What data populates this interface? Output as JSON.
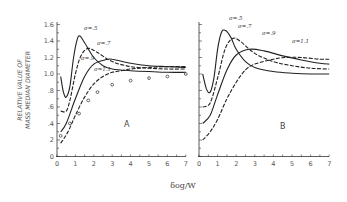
{
  "chart_data": [
    {
      "type": "line",
      "panel": "A",
      "title": "A",
      "xlabel": "δog/W",
      "ylabel": "RELATIVE VALUE OF MASS MEDIAN DIAMETER",
      "xlim": [
        0,
        7
      ],
      "ylim": [
        0,
        1.6
      ],
      "x_ticks": [
        "0",
        "1",
        "2",
        "3",
        "4",
        "5",
        "6",
        "7"
      ],
      "y_ticks": [
        "0",
        "2",
        ".4",
        ".6",
        ".8",
        "1.0",
        "1.2",
        "1.4",
        "1.6"
      ],
      "grid": false,
      "series": [
        {
          "name": "σ=.5",
          "style": "solid",
          "points": [
            [
              0.2,
              0.97
            ],
            [
              0.35,
              0.78
            ],
            [
              0.5,
              0.72
            ],
            [
              0.7,
              0.85
            ],
            [
              0.9,
              1.2
            ],
            [
              1.1,
              1.42
            ],
            [
              1.25,
              1.46
            ],
            [
              1.5,
              1.38
            ],
            [
              2.0,
              1.2
            ],
            [
              2.5,
              1.1
            ],
            [
              3.0,
              1.06
            ],
            [
              4.0,
              1.04
            ],
            [
              5.0,
              1.03
            ],
            [
              6.0,
              1.02
            ],
            [
              7.0,
              1.02
            ]
          ]
        },
        {
          "name": "σ=.7",
          "style": "dashed",
          "points": [
            [
              0.2,
              0.55
            ],
            [
              0.5,
              0.55
            ],
            [
              0.7,
              0.68
            ],
            [
              1.0,
              1.0
            ],
            [
              1.3,
              1.22
            ],
            [
              1.7,
              1.31
            ],
            [
              2.2,
              1.26
            ],
            [
              3.0,
              1.15
            ],
            [
              4.0,
              1.09
            ],
            [
              5.0,
              1.07
            ],
            [
              6.0,
              1.06
            ],
            [
              7.0,
              1.06
            ]
          ]
        },
        {
          "name": "σ=.9",
          "style": "solid",
          "points": [
            [
              0.2,
              0.3
            ],
            [
              0.5,
              0.4
            ],
            [
              1.0,
              0.7
            ],
            [
              1.5,
              0.97
            ],
            [
              2.0,
              1.12
            ],
            [
              2.6,
              1.17
            ],
            [
              3.0,
              1.18
            ],
            [
              4.0,
              1.13
            ],
            [
              5.0,
              1.1
            ],
            [
              6.0,
              1.09
            ],
            [
              7.0,
              1.08
            ]
          ]
        },
        {
          "name": "σ=1.1",
          "style": "dashed",
          "points": [
            [
              0.2,
              0.16
            ],
            [
              0.6,
              0.3
            ],
            [
              1.0,
              0.5
            ],
            [
              1.5,
              0.72
            ],
            [
              2.0,
              0.88
            ],
            [
              2.5,
              0.97
            ],
            [
              3.0,
              1.02
            ],
            [
              3.5,
              1.04
            ],
            [
              4.0,
              1.06
            ],
            [
              5.0,
              1.08
            ],
            [
              6.0,
              1.09
            ],
            [
              7.0,
              1.09
            ]
          ]
        },
        {
          "name": "experimental",
          "style": "markers",
          "points": [
            [
              0.2,
              0.25
            ],
            [
              0.7,
              0.4
            ],
            [
              1.2,
              0.52
            ],
            [
              1.7,
              0.68
            ],
            [
              2.2,
              0.78
            ],
            [
              3.0,
              0.87
            ],
            [
              4.0,
              0.92
            ],
            [
              5.0,
              0.95
            ],
            [
              6.0,
              0.97
            ],
            [
              7.0,
              1.0
            ]
          ]
        }
      ]
    },
    {
      "type": "line",
      "panel": "B",
      "title": "B",
      "xlabel": "δog/W",
      "xlim": [
        0,
        7
      ],
      "ylim": [
        0,
        1.6
      ],
      "x_ticks": [
        "0",
        "1",
        "2",
        "3",
        "4",
        "5",
        "6",
        "7"
      ],
      "grid": false,
      "series": [
        {
          "name": "σ=.5",
          "style": "solid",
          "points": [
            [
              0.2,
              1.0
            ],
            [
              0.4,
              0.82
            ],
            [
              0.6,
              0.78
            ],
            [
              0.8,
              0.95
            ],
            [
              1.0,
              1.3
            ],
            [
              1.2,
              1.5
            ],
            [
              1.4,
              1.53
            ],
            [
              1.7,
              1.45
            ],
            [
              2.0,
              1.3
            ],
            [
              2.5,
              1.15
            ],
            [
              3.0,
              1.08
            ],
            [
              4.0,
              1.03
            ],
            [
              5.0,
              1.01
            ],
            [
              6.0,
              1.0
            ],
            [
              7.0,
              1.0
            ]
          ]
        },
        {
          "name": "σ=.7",
          "style": "dashed",
          "points": [
            [
              0.2,
              0.6
            ],
            [
              0.6,
              0.65
            ],
            [
              1.0,
              0.95
            ],
            [
              1.4,
              1.3
            ],
            [
              1.8,
              1.43
            ],
            [
              2.2,
              1.4
            ],
            [
              3.0,
              1.25
            ],
            [
              4.0,
              1.15
            ],
            [
              5.0,
              1.1
            ],
            [
              6.0,
              1.07
            ],
            [
              7.0,
              1.06
            ]
          ]
        },
        {
          "name": "σ=.9",
          "style": "solid",
          "points": [
            [
              0.2,
              0.4
            ],
            [
              0.6,
              0.5
            ],
            [
              1.0,
              0.75
            ],
            [
              1.5,
              1.05
            ],
            [
              2.0,
              1.23
            ],
            [
              2.7,
              1.3
            ],
            [
              3.5,
              1.28
            ],
            [
              4.5,
              1.22
            ],
            [
              5.5,
              1.17
            ],
            [
              6.5,
              1.13
            ],
            [
              7.0,
              1.12
            ]
          ]
        },
        {
          "name": "σ=1.1",
          "style": "dashed",
          "points": [
            [
              0.2,
              0.2
            ],
            [
              0.6,
              0.3
            ],
            [
              1.0,
              0.45
            ],
            [
              1.5,
              0.7
            ],
            [
              2.0,
              0.9
            ],
            [
              2.5,
              1.05
            ],
            [
              3.0,
              1.12
            ],
            [
              4.0,
              1.18
            ],
            [
              4.6,
              1.2
            ],
            [
              5.5,
              1.2
            ],
            [
              6.5,
              1.18
            ],
            [
              7.0,
              1.18
            ]
          ]
        }
      ]
    }
  ],
  "labels": {
    "ylabel_line1": "RELATIVE VALUE OF",
    "ylabel_line2": "MASS MEDIAN DIAMETER",
    "xlabel": "δog/W",
    "panel_a": "A",
    "panel_b": "B",
    "curve_a_05": "σ=.5",
    "curve_a_07": "σ=.7",
    "curve_a_09": "σ=.9",
    "curve_a_11": "σ=1.1",
    "curve_b_05": "σ=.5",
    "curve_b_07": "σ=.7",
    "curve_b_09": "σ=.9",
    "curve_b_11": "σ=1.1"
  },
  "ticks": {
    "x": [
      "0",
      "1",
      "2",
      "3",
      "4",
      "5",
      "6",
      "7"
    ],
    "y": [
      "0",
      "2",
      ".4",
      ".6",
      ".8",
      "1.0",
      "1.2",
      "1.4",
      "1.6"
    ]
  }
}
